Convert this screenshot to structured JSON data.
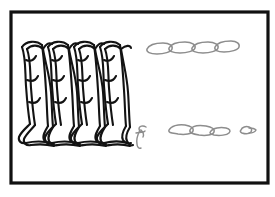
{
  "figure": {
    "canvas": {
      "width": 275,
      "height": 197,
      "background": "#ffffff"
    },
    "frame": {
      "name": "image-border",
      "x": 11,
      "y": 12,
      "width": 257,
      "height": 171,
      "stroke": "#111111",
      "stroke_width": 3.2,
      "fill": "#ffffff"
    },
    "colors": {
      "background": "#ffffff",
      "border": "#111111",
      "knit_line": "#131313",
      "chain_line": "#8d8d8d",
      "hook_line": "#8d8d8d"
    },
    "knit_fabric": {
      "name": "knitted-loop-fabric",
      "description": "Hand-drawn weft-knit fabric showing interlocking loops",
      "wales": 4,
      "courses": 1,
      "bounds": {
        "x": 16,
        "y": 40,
        "width": 112,
        "height": 108
      },
      "stroke": "#131313",
      "stroke_width": 2.1,
      "wale_centers": [
        37,
        63,
        89,
        114
      ],
      "loop_top_y": 46,
      "loop_bottom_y": 126,
      "base_row_y": 134
    },
    "chain_top": {
      "name": "chain-row-top",
      "link_count": 4,
      "y_center": 48,
      "x_start": 145,
      "x_end": 238,
      "link_width": 26,
      "link_height": 11,
      "link_pitch": 23,
      "stroke": "#8d8d8d",
      "stroke_width": 1.5
    },
    "chain_bottom": {
      "name": "chain-row-bottom",
      "link_count": 3,
      "y_center": 130,
      "x_start": 168,
      "x_end": 229,
      "link_width": 25,
      "link_height": 10,
      "link_pitch": 22,
      "stroke": "#8d8d8d",
      "stroke_width": 1.5
    },
    "chain_fragment": {
      "name": "chain-fragment-single",
      "link_count": 1,
      "y_center": 130,
      "x_start": 240,
      "x_end": 256,
      "link_width": 16,
      "link_height": 9,
      "stroke": "#8d8d8d",
      "stroke_width": 1.5
    },
    "hook": {
      "name": "loose-yarn-hook",
      "description": "Small curled loose yarn end resembling a hook",
      "x": 136,
      "y": 126,
      "width": 14,
      "height": 24,
      "stroke": "#8d8d8d",
      "stroke_width": 1.4
    }
  }
}
